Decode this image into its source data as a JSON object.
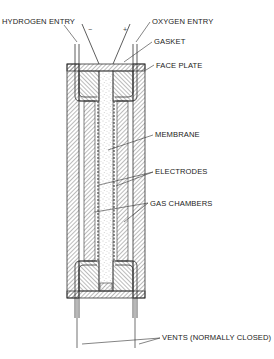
{
  "diagram": {
    "type": "fuel-cell cross-section",
    "colors": {
      "line": "#333333",
      "hatch": "#555555",
      "stipple": "#888888",
      "background": "#ffffff"
    },
    "labels": {
      "hydrogen_entry": "HYDROGEN ENTRY",
      "oxygen_entry": "OXYGEN ENTRY",
      "gasket": "GASKET",
      "face_plate": "FACE PLATE",
      "membrane": "MEMBRANE",
      "electrodes": "ELECTRODES",
      "gas_chambers": "GAS CHAMBERS",
      "vents": "VENTS (NORMALLY CLOSED)"
    },
    "terminals": {
      "negative": "−",
      "positive": "+"
    }
  }
}
